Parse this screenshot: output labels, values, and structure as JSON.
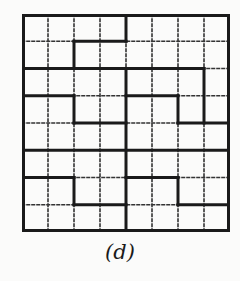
{
  "figure": {
    "caption": "(d)",
    "grid": {
      "columns": 8,
      "rows": 8,
      "thin_line_style": "dotted",
      "thick_line_color": "#1a1a1a",
      "thin_line_color": "#333333",
      "thick_horizontal": [
        {
          "row": 0,
          "from": 0,
          "to": 8
        },
        {
          "row": 1,
          "from": 2,
          "to": 4
        },
        {
          "row": 2,
          "from": 0,
          "to": 7
        },
        {
          "row": 3,
          "from": 0,
          "to": 2
        },
        {
          "row": 3,
          "from": 4,
          "to": 6
        },
        {
          "row": 4,
          "from": 2,
          "to": 4
        },
        {
          "row": 4,
          "from": 6,
          "to": 8
        },
        {
          "row": 5,
          "from": 0,
          "to": 8
        },
        {
          "row": 6,
          "from": 0,
          "to": 2
        },
        {
          "row": 6,
          "from": 4,
          "to": 6
        },
        {
          "row": 7,
          "from": 2,
          "to": 4
        },
        {
          "row": 7,
          "from": 6,
          "to": 8
        },
        {
          "row": 8,
          "from": 0,
          "to": 8
        }
      ],
      "thick_vertical": [
        {
          "col": 0,
          "from": 0,
          "to": 8
        },
        {
          "col": 2,
          "from": 1,
          "to": 2
        },
        {
          "col": 2,
          "from": 3,
          "to": 4
        },
        {
          "col": 2,
          "from": 6,
          "to": 7
        },
        {
          "col": 4,
          "from": 0,
          "to": 1
        },
        {
          "col": 4,
          "from": 2,
          "to": 8
        },
        {
          "col": 6,
          "from": 3,
          "to": 4
        },
        {
          "col": 6,
          "from": 6,
          "to": 7
        },
        {
          "col": 7,
          "from": 2,
          "to": 4
        },
        {
          "col": 8,
          "from": 0,
          "to": 8
        }
      ]
    }
  }
}
